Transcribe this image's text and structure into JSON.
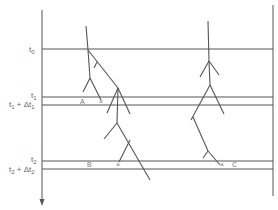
{
  "diagram": {
    "time_labels": [
      {
        "id": "t0",
        "base": "t",
        "sub": "0",
        "y": 49
      },
      {
        "id": "t1",
        "base": "t",
        "sub": "1",
        "y": 97
      },
      {
        "id": "t1_dt1",
        "text": "t₁ + Δt₁",
        "y": 105
      },
      {
        "id": "t2",
        "base": "t",
        "sub": "2",
        "y": 161
      },
      {
        "id": "t2_dt2",
        "text": "t₂ + Δt₂",
        "y": 169
      }
    ],
    "markers": [
      {
        "id": "A",
        "label": "A"
      },
      {
        "id": "x1",
        "label": "×"
      },
      {
        "id": "B",
        "label": "B"
      },
      {
        "id": "x2",
        "label": "×"
      },
      {
        "id": "x3",
        "label": "×"
      },
      {
        "id": "C",
        "label": "C"
      }
    ],
    "axis": {
      "direction": "down",
      "arrow": "arrow-down"
    }
  }
}
